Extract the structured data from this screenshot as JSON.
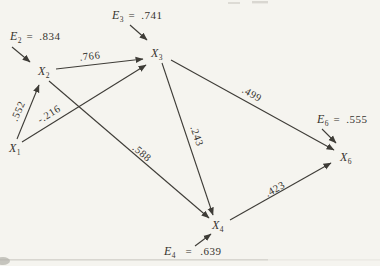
{
  "figure": {
    "type": "path-diagram",
    "colors": {
      "ink": "#3e3c37",
      "text": "#35332e",
      "paper": "#f5f4ef"
    },
    "nodes": {
      "x1": {
        "letter": "X",
        "sub": "1"
      },
      "x2": {
        "letter": "X",
        "sub": "2"
      },
      "x3": {
        "letter": "X",
        "sub": "3"
      },
      "x4": {
        "letter": "X",
        "sub": "4"
      },
      "x6": {
        "letter": "X",
        "sub": "6"
      }
    },
    "errors": {
      "e2": {
        "letter": "E",
        "sub": "2",
        "equals": "=",
        "value": ".834"
      },
      "e3": {
        "letter": "E",
        "sub": "3",
        "equals": "=",
        "value": ".741"
      },
      "e4": {
        "letter": "E",
        "sub": "4",
        "equals": "=",
        "value": ".639"
      },
      "e6": {
        "letter": "E",
        "sub": "6",
        "equals": "=",
        "value": ".555"
      }
    },
    "coefficients": {
      "x1_x2": ".552",
      "x1_x3": "-.216",
      "x2_x3": ".766",
      "x2_x4": ".588",
      "x3_x4": ".243",
      "x3_x6": ".499",
      "x4_x6": ".423"
    }
  }
}
